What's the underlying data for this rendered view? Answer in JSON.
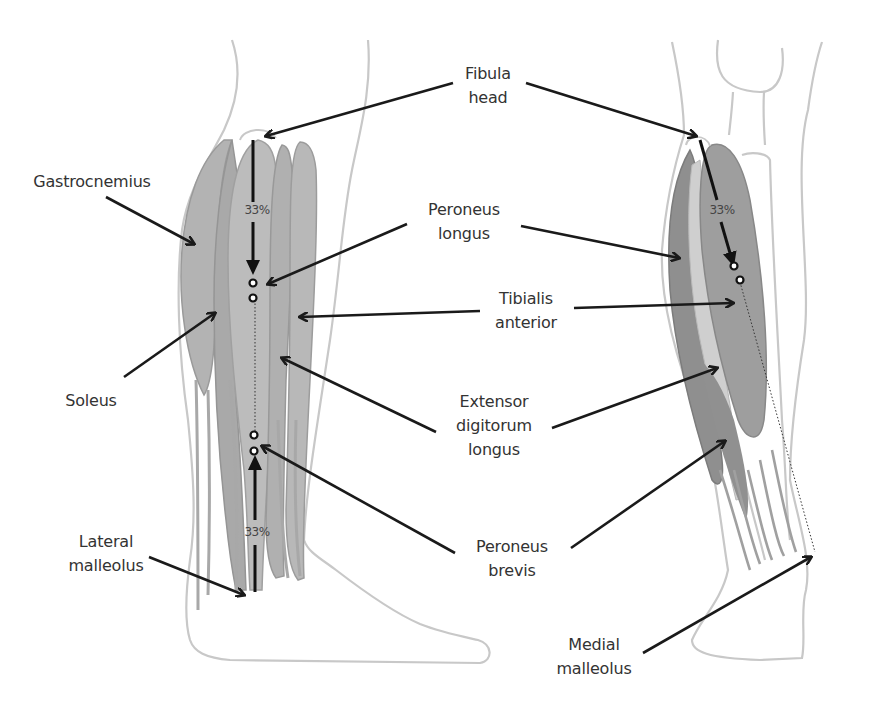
{
  "diagram": {
    "colors": {
      "outline": "#c8c8c8",
      "muscle_light": "#bdbdbd",
      "muscle_mid": "#a8a8a8",
      "muscle_dark": "#8c8c8c",
      "arrow": "#1a1a1a",
      "text": "#333333"
    },
    "views": [
      {
        "id": "lateral",
        "name": "Lateral view (left leg)"
      },
      {
        "id": "medial",
        "name": "Medial view (right leg)"
      }
    ],
    "labels": {
      "fibula_head": {
        "line1": "Fibula",
        "line2": "head"
      },
      "gastrocnemius": {
        "line1": "Gastrocnemius"
      },
      "peroneus_longus": {
        "line1": "Peroneus",
        "line2": "longus"
      },
      "tibialis_anterior": {
        "line1": "Tibialis",
        "line2": "anterior"
      },
      "soleus": {
        "line1": "Soleus"
      },
      "extensor_digitorum_longus": {
        "line1": "Extensor",
        "line2": "digitorum",
        "line3": "longus"
      },
      "lateral_malleolus": {
        "line1": "Lateral",
        "line2": "malleolus"
      },
      "peroneus_brevis": {
        "line1": "Peroneus",
        "line2": "brevis"
      },
      "medial_malleolus": {
        "line1": "Medial",
        "line2": "malleolus"
      }
    },
    "measurements": {
      "left_top": "33%",
      "left_bottom": "33%",
      "right_top": "33%"
    }
  }
}
